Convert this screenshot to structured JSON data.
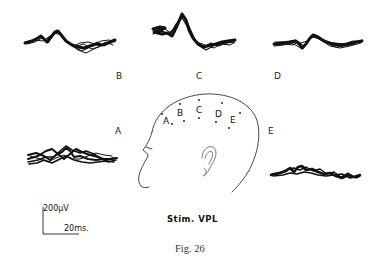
{
  "figure": {
    "caption": "Fig. 26",
    "stimulus_label": "Stim. VPL",
    "scale_bar": {
      "voltage": "200µV",
      "time": "20ms."
    },
    "traces": [
      {
        "id": "B",
        "label": "B",
        "position": "top-left"
      },
      {
        "id": "C",
        "label": "C",
        "position": "top-center"
      },
      {
        "id": "D",
        "label": "D",
        "position": "top-right"
      },
      {
        "id": "A",
        "label": "A",
        "position": "middle-left"
      },
      {
        "id": "E",
        "label": "E",
        "position": "middle-right"
      }
    ],
    "head_diagram": {
      "electrode_labels": [
        "A",
        "B",
        "C",
        "D",
        "E"
      ]
    },
    "colors": {
      "ink": "#111111",
      "background": "#ffffff"
    }
  }
}
